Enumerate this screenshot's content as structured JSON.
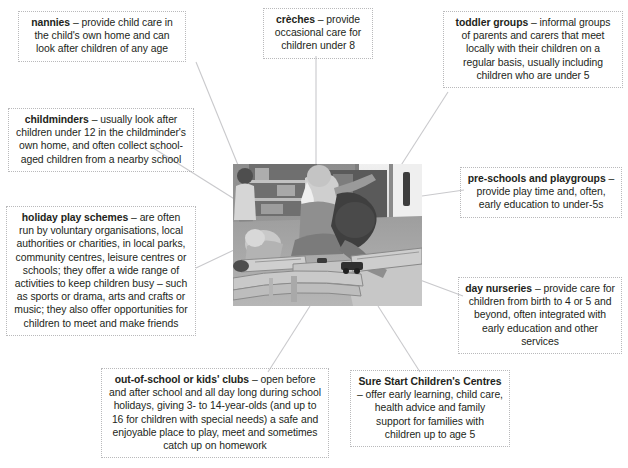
{
  "diagram": {
    "center_image": {
      "name": "children-playing-photo",
      "description": "Black and white photograph of a childminder and children playing with a wooden train track set on the floor of a nursery playroom"
    },
    "callouts": [
      {
        "id": "nannies",
        "term": "nannies",
        "dash": " – ",
        "text": "provide child care in the child's own home and can look after children of any age",
        "full": "nannies – provide child care in the child's own home and can look after children of any age"
      },
      {
        "id": "childminders",
        "term": "childminders",
        "dash": " – ",
        "text": "usually look after children under 12 in the childminder's own home, and often collect school-aged children from a nearby school",
        "full": "childminders – usually look after children under 12 in the childminder's own home, and often collect school-aged children from a nearby school"
      },
      {
        "id": "holiday-play-schemes",
        "term": "holiday play schemes",
        "dash": " – ",
        "text": "are often run by voluntary organisations, local authorities or charities, in local parks, community centres, leisure centres or schools; they offer a wide range of activities to keep children busy – such as sports or drama, arts and crafts or music; they also offer opportunities for children to meet and make friends",
        "full": "holiday play schemes – are often run by voluntary organisations, local authorities or charities, in local parks, community centres, leisure centres or schools; they offer a wide range of activities to keep children busy – such as sports or drama, arts and crafts or music; they also offer opportunities for children to meet and make friends"
      },
      {
        "id": "creches",
        "term": "crèches",
        "dash": " – ",
        "text": "provide occasional care for children under 8",
        "full": "crèches – provide occasional care for children under 8"
      },
      {
        "id": "toddler-groups",
        "term": "toddler groups",
        "dash": " – ",
        "text": "informal groups of parents and carers that meet locally with their children on a regular basis, usually including children who are under 5",
        "full": "toddler groups – informal groups of parents and carers that meet locally with their children on a regular basis, usually including children who are under 5"
      },
      {
        "id": "pre-schools-and-playgroups",
        "term": "pre-schools and playgroups",
        "dash": " – ",
        "text": "provide play time and, often, early education to under-5s",
        "full": "pre-schools and playgroups – provide play time and, often, early education to under-5s"
      },
      {
        "id": "day-nurseries",
        "term": "day nurseries",
        "dash": " – ",
        "text": "provide care for children from birth to 4 or 5 and beyond, often integrated with early education and other services",
        "full": "day nurseries – provide care for children from birth to 4 or 5 and beyond, often integrated with early education and other services"
      },
      {
        "id": "sure-start-childrens-centres",
        "term": "Sure Start Children's Centres",
        "dash": " – ",
        "text": "offer early learning, child care, health advice and family support for families with children up to age 5",
        "full": "Sure Start Children's Centres – offer early learning, child care, health advice and family support for families with children up to age 5"
      },
      {
        "id": "out-of-school-or-kids-clubs",
        "term": "out-of-school or kids' clubs",
        "dash": " – ",
        "text": "open before and after school and all day long during school holidays, giving 3- to 14-year-olds (and up to 16 for children with special needs) a safe and enjoyable place to play, meet and sometimes catch up on homework",
        "full": "out-of-school or kids' clubs – open before and after school and all day long during school holidays, giving 3- to 14-year-olds (and up to 16 for children with special needs) a safe and enjoyable place to play, meet and sometimes catch up on homework"
      }
    ],
    "colors": {
      "text": "#231f20",
      "box_border": "#b9b9bb",
      "connector_line": "#c9c9cc",
      "background": "#ffffff"
    }
  }
}
